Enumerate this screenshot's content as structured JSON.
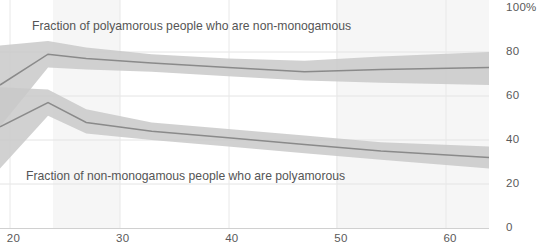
{
  "chart_data": {
    "type": "line",
    "title": "",
    "subtitle": "",
    "xlabel": "",
    "ylabel": "",
    "xlim": [
      19.1,
      63.9
    ],
    "ylim": [
      0,
      100
    ],
    "grid": true,
    "legend_position": "inline-annotations",
    "x_ticks": [
      20,
      30,
      40,
      50,
      60
    ],
    "x_tick_labels": [
      "20",
      "30",
      "40",
      "50",
      "60"
    ],
    "y_ticks": [
      0,
      20,
      40,
      60,
      80,
      100
    ],
    "y_tick_labels": [
      "0",
      "20",
      "40",
      "60",
      "80",
      "100%"
    ],
    "y_axis_side": "right",
    "band_color": "#c9c9c9",
    "line_color": "#8a8a8a",
    "grid_color": "#e4e4e4",
    "series": [
      {
        "name": "Fraction of polyamorous people who are non-monogamous",
        "x": [
          19.1,
          23.5,
          27.0,
          33.0,
          40.0,
          47.0,
          54.0,
          63.9
        ],
        "values": [
          65,
          79,
          77,
          75,
          73,
          71,
          72,
          73
        ],
        "band_lower": [
          46,
          73,
          72,
          71,
          69,
          67,
          66,
          65
        ],
        "band_upper": [
          83,
          85,
          82,
          79,
          77,
          76,
          78,
          80
        ],
        "annotation": "Fraction of polyamorous people who are non-monogamous"
      },
      {
        "name": "Fraction of non-monogamous people who are polyamorous",
        "x": [
          19.1,
          23.5,
          27.0,
          33.0,
          40.0,
          47.0,
          54.0,
          63.9
        ],
        "values": [
          46,
          57,
          48,
          44,
          41,
          38,
          35,
          32
        ],
        "band_lower": [
          27,
          51,
          43,
          40,
          37,
          34,
          31,
          27
        ],
        "band_upper": [
          64,
          63,
          54,
          48,
          45,
          42,
          39,
          37
        ],
        "annotation": "Fraction of non-monogamous people who are polyamorous"
      }
    ],
    "shaded_x_bands": [
      {
        "from": 21.8,
        "to": 24.8
      },
      {
        "from": 40.0,
        "to": 63.9
      }
    ]
  }
}
